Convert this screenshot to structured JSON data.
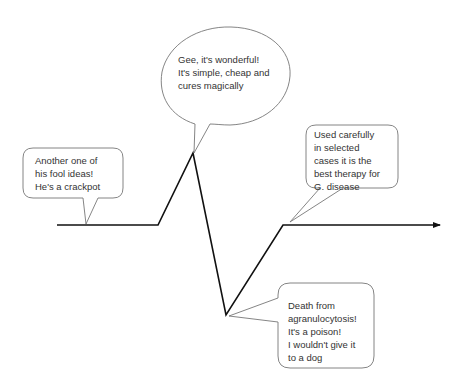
{
  "diagram": {
    "type": "hype-curve",
    "colors": {
      "curve": "#111111",
      "bubble_stroke": "#777777",
      "text": "#333333",
      "background": "#ffffff"
    },
    "curve_points": [
      [
        57,
        225
      ],
      [
        158,
        225
      ],
      [
        193,
        153
      ],
      [
        226,
        315
      ],
      [
        283,
        225
      ],
      [
        440,
        225
      ]
    ],
    "bubbles": [
      {
        "id": "skepticism",
        "shape": "rounded-rect",
        "lines": [
          "Another one of",
          "his fool ideas!",
          "He's a crackpot"
        ]
      },
      {
        "id": "enthusiasm",
        "shape": "ellipse",
        "lines": [
          "Gee, it's wonderful!",
          "It's simple, cheap and",
          "cures magically"
        ]
      },
      {
        "id": "rejection",
        "shape": "rounded-rect",
        "lines": [
          "Death from",
          "agranulocytosis!",
          "It's a poison!",
          "I wouldn't give it",
          "to a dog"
        ]
      },
      {
        "id": "acceptance",
        "shape": "rounded-rect",
        "lines": [
          "Used carefully",
          "in selected",
          "cases it is the",
          "best therapy for",
          "G. disease"
        ]
      }
    ]
  },
  "text": {
    "skepticism": "Another one of\nhis fool ideas!\nHe's a crackpot",
    "enthusiasm": "Gee, it's wonderful!\nIt's simple, cheap and\ncures magically",
    "rejection": "Death from\nagranulocytosis!\nIt's a poison!\nI wouldn't give it\nto a dog",
    "acceptance": "Used carefully\nin selected\ncases it is the\nbest therapy for\nG. disease"
  }
}
